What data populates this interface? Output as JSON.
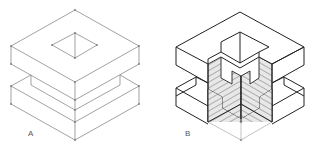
{
  "figure": {
    "views": [
      {
        "id": "A",
        "label": "A",
        "description": "Exploded isometric wireframe of two square slabs; upper slab has a square opening on top",
        "style": "thin-line"
      },
      {
        "id": "B",
        "label": "B",
        "description": "Assembled isometric cutaway with hatched section faces showing interlocking joint",
        "style": "bold-line-hatched"
      }
    ],
    "colors": {
      "thin_line": "#7a7a7a",
      "bold_line": "#222222",
      "hatch_fill": "#e6e6e6",
      "hatch_line": "#555555",
      "construction_line": "#9a9a9a",
      "background": "#ffffff"
    }
  }
}
